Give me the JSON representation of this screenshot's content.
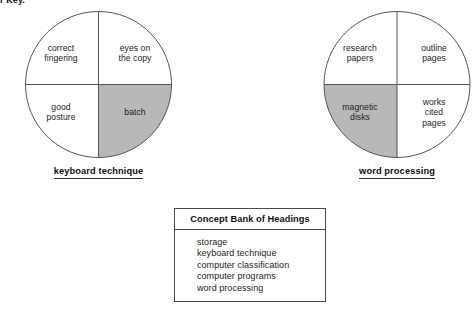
{
  "page": {
    "header_text": "r Key.",
    "background_color": "#ffffff",
    "shaded_fill_color": "#b8b8b8",
    "unshaded_fill_color": "#ffffff",
    "stroke_color": "#555555"
  },
  "diagrams": [
    {
      "id": "keyboard-technique",
      "caption": "keyboard technique",
      "quadrants": [
        {
          "position": "top-left",
          "label": "correct\nfingering",
          "shaded": false
        },
        {
          "position": "top-right",
          "label": "eyes on\nthe copy",
          "shaded": false
        },
        {
          "position": "bottom-left",
          "label": "good\nposture",
          "shaded": false
        },
        {
          "position": "bottom-right",
          "label": "batch",
          "shaded": true
        }
      ]
    },
    {
      "id": "word-processing",
      "caption": "word processing",
      "quadrants": [
        {
          "position": "top-left",
          "label": "research\npapers",
          "shaded": false
        },
        {
          "position": "top-right",
          "label": "outline\npages",
          "shaded": false
        },
        {
          "position": "bottom-left",
          "label": "magnetic\ndisks",
          "shaded": true
        },
        {
          "position": "bottom-right",
          "label": "works\ncited\npages",
          "shaded": false
        }
      ]
    }
  ],
  "concept_bank": {
    "title": "Concept Bank of Headings",
    "items": [
      "storage",
      "keyboard technique",
      "computer classification",
      "computer programs",
      "word processing"
    ]
  }
}
